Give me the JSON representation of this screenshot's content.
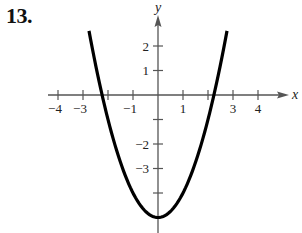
{
  "problem": {
    "number": "13."
  },
  "chart_data": {
    "type": "line",
    "title": "",
    "function": "y = x^2 - 5",
    "xlabel": "x",
    "ylabel": "y",
    "xlim": [
      -4.4,
      5.1
    ],
    "ylim": [
      -5.6,
      3.0
    ],
    "x_ticks": [
      -4,
      -3,
      -2,
      -1,
      1,
      2,
      3,
      4
    ],
    "x_tick_labels": [
      "−4",
      "−3",
      "",
      "−1",
      "1",
      "",
      "3",
      "4"
    ],
    "y_ticks": [
      2,
      1,
      -1,
      -2,
      -3,
      -4
    ],
    "y_tick_labels": [
      "2",
      "1",
      "",
      "−2",
      "−3",
      ""
    ],
    "series": [
      {
        "name": "parabola",
        "x_range": [
          -2.76,
          2.76
        ],
        "points": [
          [
            -2.76,
            2.62
          ],
          [
            -2.5,
            1.25
          ],
          [
            -2.24,
            0.0
          ],
          [
            -2.0,
            -1.0
          ],
          [
            -1.5,
            -2.75
          ],
          [
            -1.0,
            -4.0
          ],
          [
            -0.5,
            -4.75
          ],
          [
            0.0,
            -5.0
          ],
          [
            0.5,
            -4.75
          ],
          [
            1.0,
            -4.0
          ],
          [
            1.5,
            -2.75
          ],
          [
            2.0,
            -1.0
          ],
          [
            2.24,
            0.0
          ],
          [
            2.5,
            1.25
          ],
          [
            2.76,
            2.62
          ]
        ],
        "vertex": [
          0,
          -5
        ],
        "x_intercepts": [
          -2.24,
          2.24
        ],
        "color": "#000000"
      }
    ],
    "grid": false,
    "legend": null
  }
}
